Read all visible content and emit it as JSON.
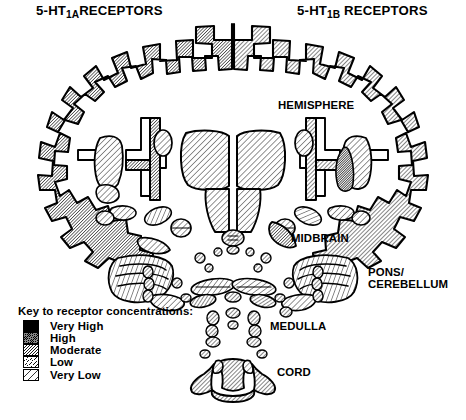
{
  "figure": {
    "type": "anatomical-diagram",
    "titles": {
      "left_prefix": "5-HT",
      "left_subscript": "1A",
      "left_suffix": "RECEPTORS",
      "right_prefix": "5-HT",
      "right_subscript": "1B",
      "right_suffix": "RECEPTORS"
    },
    "region_labels": {
      "hemisphere": "HEMISPHERE",
      "midbrain": "MIDBRAIN",
      "pons_line1": "PONS/",
      "pons_line2": "CEREBELLUM",
      "medulla": "MEDULLA",
      "cord": "CORD"
    }
  },
  "legend": {
    "title": "Key to receptor concentrations:",
    "items": [
      {
        "label": "Very High",
        "level": 5,
        "hatch_spacing_px": 1.6,
        "hatch_weight_px": 1.25
      },
      {
        "label": "High",
        "level": 4,
        "hatch_spacing_px": 2.3,
        "hatch_weight_px": 1.05
      },
      {
        "label": "Moderate",
        "level": 3,
        "hatch_spacing_px": 3.0,
        "hatch_weight_px": 0.9
      },
      {
        "label": "Low",
        "level": 2,
        "hatch_spacing_px": 4.2,
        "hatch_weight_px": 0.8
      },
      {
        "label": "Very Low",
        "level": 1,
        "hatch_spacing_px": 7.0,
        "hatch_weight_px": 0.8
      }
    ]
  },
  "colors": {
    "ink": "#000000",
    "paper": "#ffffff"
  },
  "structures": {
    "left_hemisphere_side": "5-HT1A",
    "right_hemisphere_side": "5-HT1B",
    "left_cortical_ribbon_level": 4,
    "right_cortical_ribbon_level": 3,
    "left_hippocampus_level": 3,
    "right_globus_pallidus_level": 5,
    "thalamus_level": 2,
    "hypothalamus_level": 2,
    "cerebellum_level": 2,
    "spinal_cord_level": 3
  }
}
